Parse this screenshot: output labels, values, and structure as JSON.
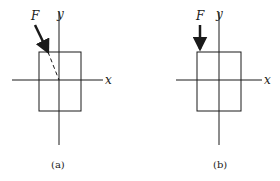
{
  "figure": {
    "panels": [
      {
        "id": "a",
        "caption": "(a)",
        "force_label": "F",
        "x_axis_label": "x",
        "y_axis_label": "y",
        "force_direction": "inclined, line of action passes through origin (shown dashed)"
      },
      {
        "id": "b",
        "caption": "(b)",
        "force_label": "F",
        "x_axis_label": "x",
        "y_axis_label": "y",
        "force_direction": "vertical downward, applied at top-left corner of rectangle"
      }
    ],
    "colors": {
      "ink": "#1a1a1a",
      "background": "#ffffff"
    }
  }
}
